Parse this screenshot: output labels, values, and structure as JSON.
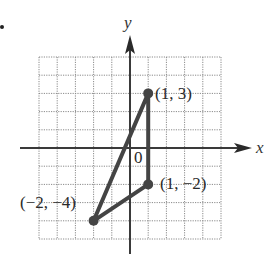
{
  "figure": {
    "x_axis_label": "x",
    "y_axis_label": "y",
    "origin_label": "0",
    "grid": {
      "xmin": -5,
      "xmax": 5,
      "ymin": -5,
      "ymax": 5,
      "step": 1
    },
    "points": [
      {
        "x": 1,
        "y": 3,
        "label": "(1, 3)"
      },
      {
        "x": 1,
        "y": -2,
        "label": "(1, −2)"
      },
      {
        "x": -2,
        "y": -4,
        "label": "(−2, −4)"
      }
    ],
    "shape": "triangle",
    "colors": {
      "line": "#444444",
      "grid": "#8a8a8a",
      "axis": "#3a3a3a"
    }
  },
  "chart_data": {
    "type": "scatter",
    "title": "",
    "xlabel": "x",
    "ylabel": "y",
    "xlim": [
      -5,
      5
    ],
    "ylim": [
      -5,
      5
    ],
    "grid": true,
    "series": [
      {
        "name": "triangle vertices",
        "x": [
          1,
          1,
          -2
        ],
        "y": [
          3,
          -2,
          -4
        ],
        "labels": [
          "(1, 3)",
          "(1, −2)",
          "(−2, −4)"
        ],
        "connected": true,
        "closed": true
      }
    ],
    "annotations": [
      "0"
    ]
  }
}
